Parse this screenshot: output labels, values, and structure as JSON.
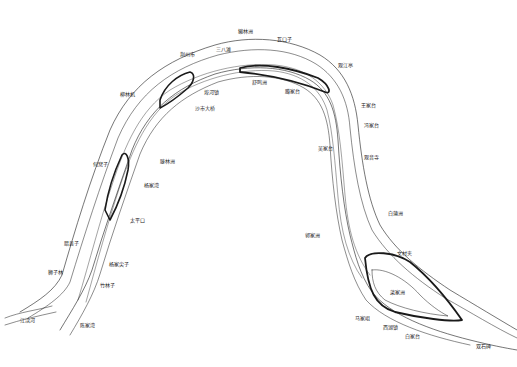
{
  "map": {
    "title": "",
    "subject": "River meander bend map",
    "line_color": "#1a1a1a",
    "background": "#ffffff",
    "labels": [
      {
        "id": "l1",
        "text": "獭林洲",
        "x": 238,
        "y": 29
      },
      {
        "id": "l2",
        "text": "瓦口子",
        "x": 277,
        "y": 37
      },
      {
        "id": "l3",
        "text": "三八滩",
        "x": 216,
        "y": 47
      },
      {
        "id": "l4",
        "text": "荆州市",
        "x": 180,
        "y": 52
      },
      {
        "id": "l5",
        "text": "柳林机",
        "x": 120,
        "y": 92
      },
      {
        "id": "l6",
        "text": "埠河镇",
        "x": 204,
        "y": 90
      },
      {
        "id": "l7",
        "text": "沙市大桥",
        "x": 195,
        "y": 106
      },
      {
        "id": "l8",
        "text": "舒鸣洲",
        "x": 252,
        "y": 80
      },
      {
        "id": "l9",
        "text": "腾家台",
        "x": 285,
        "y": 89
      },
      {
        "id": "l10",
        "text": "观江亭",
        "x": 338,
        "y": 63
      },
      {
        "id": "l11",
        "text": "王家台",
        "x": 361,
        "y": 103
      },
      {
        "id": "l12",
        "text": "冯家台",
        "x": 364,
        "y": 123
      },
      {
        "id": "l13",
        "text": "吴家台",
        "x": 318,
        "y": 146
      },
      {
        "id": "l14",
        "text": "观音寺",
        "x": 364,
        "y": 155
      },
      {
        "id": "l15",
        "text": "何窝子",
        "x": 93,
        "y": 162
      },
      {
        "id": "l16",
        "text": "滕林洲",
        "x": 160,
        "y": 159
      },
      {
        "id": "l17",
        "text": "杨家湾",
        "x": 144,
        "y": 183
      },
      {
        "id": "l18",
        "text": "太平口",
        "x": 130,
        "y": 218
      },
      {
        "id": "l19",
        "text": "白蒲洲",
        "x": 388,
        "y": 211
      },
      {
        "id": "l20",
        "text": "郭家洲",
        "x": 305,
        "y": 233
      },
      {
        "id": "l21",
        "text": "文村夹",
        "x": 397,
        "y": 251
      },
      {
        "id": "l22",
        "text": "腊县子",
        "x": 64,
        "y": 241
      },
      {
        "id": "l23",
        "text": "杨家尖子",
        "x": 109,
        "y": 262
      },
      {
        "id": "l24",
        "text": "狮子林",
        "x": 48,
        "y": 270
      },
      {
        "id": "l25",
        "text": "竹林子",
        "x": 100,
        "y": 283
      },
      {
        "id": "l26",
        "text": "菜家洲",
        "x": 390,
        "y": 290
      },
      {
        "id": "l27",
        "text": "马家咀",
        "x": 355,
        "y": 316
      },
      {
        "id": "l28",
        "text": "西湖镇",
        "x": 383,
        "y": 325
      },
      {
        "id": "l29",
        "text": "白家台",
        "x": 405,
        "y": 334
      },
      {
        "id": "l30",
        "text": "双石碑",
        "x": 476,
        "y": 344
      },
      {
        "id": "l31",
        "text": "江渎河",
        "x": 20,
        "y": 318
      },
      {
        "id": "l32",
        "text": "陈家湾",
        "x": 80,
        "y": 323
      }
    ]
  }
}
